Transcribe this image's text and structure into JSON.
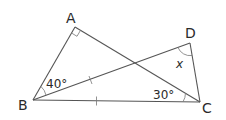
{
  "diagram": {
    "type": "geometry",
    "vertices": {
      "A": {
        "label": "A",
        "x": 75,
        "y": 27
      },
      "B": {
        "label": "B",
        "x": 33,
        "y": 100
      },
      "C": {
        "label": "C",
        "x": 200,
        "y": 102
      },
      "D": {
        "label": "D",
        "x": 190,
        "y": 43
      }
    },
    "segments": [
      "AB",
      "AC",
      "BC",
      "BD",
      "DC"
    ],
    "angles": {
      "A": {
        "label": "",
        "right_angle": true
      },
      "ABD": {
        "label": "40°"
      },
      "ACB": {
        "label": "30°"
      },
      "BDC": {
        "label": "x",
        "unknown": true
      }
    },
    "equal_marks": {
      "description": "BD = BC (single tick marks)",
      "segments": [
        "BD",
        "BC"
      ]
    },
    "colors": {
      "line": "#555555",
      "text": "#2a2a2a",
      "background": "#ffffff"
    }
  }
}
